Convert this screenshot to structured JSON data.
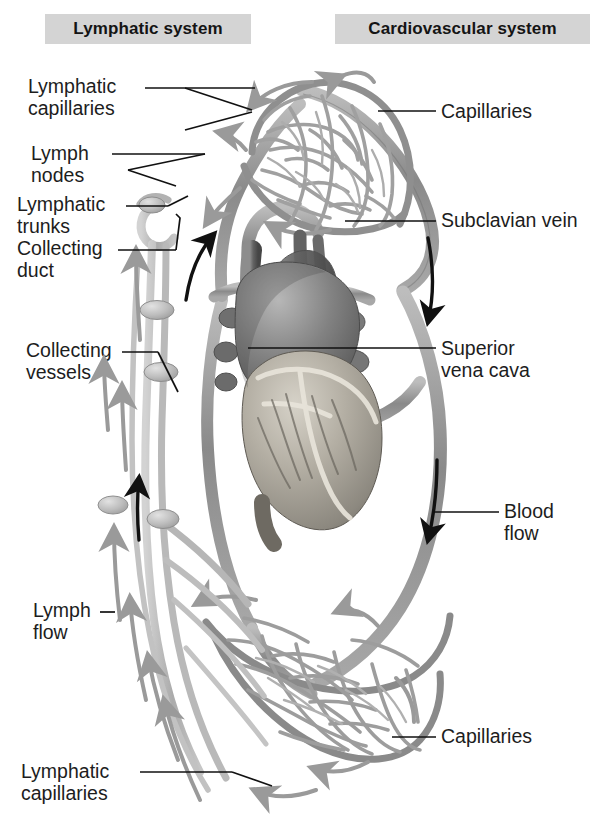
{
  "figure": {
    "kind": "anatomical-diagram",
    "background_color": "#ffffff"
  },
  "banners": {
    "left": {
      "text": "Lymphatic system",
      "background": "#d4d4d4",
      "text_color": "#141414"
    },
    "right": {
      "text": "Cardiovascular system",
      "background": "#d4d4d4",
      "text_color": "#141414"
    }
  },
  "labels": {
    "left": [
      {
        "id": "lymphatic-capillaries-top",
        "text": "Lymphatic\ncapillaries"
      },
      {
        "id": "lymph-nodes",
        "text": "Lymph\nnodes"
      },
      {
        "id": "lymphatic-trunks",
        "text": "Lymphatic\ntrunks"
      },
      {
        "id": "collecting-duct",
        "text": "Collecting\nduct"
      },
      {
        "id": "collecting-vessels",
        "text": "Collecting\nvessels"
      },
      {
        "id": "lymph-flow",
        "text": "Lymph\nflow"
      },
      {
        "id": "lymphatic-capillaries-bottom",
        "text": "Lymphatic\ncapillaries"
      }
    ],
    "right": [
      {
        "id": "capillaries-top",
        "text": "Capillaries"
      },
      {
        "id": "subclavian-vein",
        "text": "Subclavian vein"
      },
      {
        "id": "superior-vena-cava",
        "text": "Superior\nvena cava"
      },
      {
        "id": "blood-flow",
        "text": "Blood\nflow"
      },
      {
        "id": "capillaries-bottom",
        "text": "Capillaries"
      }
    ]
  },
  "structures": [
    {
      "id": "upper-capillary-bed",
      "name": "Upper capillary bed network"
    },
    {
      "id": "lower-capillary-bed",
      "name": "Lower capillary bed network"
    },
    {
      "id": "heart",
      "name": "Heart"
    },
    {
      "id": "blood-vessel-loop",
      "name": "Blood vessel loop"
    },
    {
      "id": "lymphatic-vessel-chain",
      "name": "Lymphatic vessel chain"
    },
    {
      "id": "lymph-node-1",
      "name": "Lymph node"
    },
    {
      "id": "lymph-node-2",
      "name": "Lymph node"
    },
    {
      "id": "lymph-node-3",
      "name": "Lymph node"
    },
    {
      "id": "lymph-node-4",
      "name": "Lymph node"
    }
  ],
  "flow_arrows": {
    "blood": {
      "color": "#111111",
      "count": 4,
      "description": "Black arrows showing blood flow direction"
    },
    "lymph": {
      "color": "#9a9a9a",
      "count": 10,
      "description": "Gray arrows showing lymph flow direction"
    }
  },
  "palette": {
    "vessel_gray": "#9b9b9b",
    "vessel_dark": "#6e6e6e",
    "lymph_gray": "#b4b4b4",
    "heart_dark": "#5a5a5a",
    "banner_gray": "#d4d4d4",
    "ink": "#1d1d1d"
  }
}
